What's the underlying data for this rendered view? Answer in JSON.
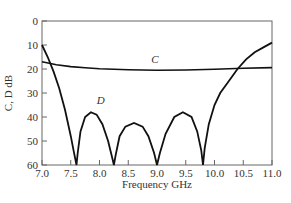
{
  "chart_data": {
    "type": "line",
    "title": "",
    "xlabel": "Frequency GHz",
    "ylabel": "C, D dB",
    "xlim": [
      7.0,
      11.0
    ],
    "ylim": [
      0,
      60
    ],
    "y_inverted": true,
    "grid": false,
    "x_ticks": [
      "7.0",
      "7.5",
      "8.0",
      "8.5",
      "9.0",
      "9.5",
      "10.0",
      "10.5",
      "11.0"
    ],
    "y_ticks": [
      "0",
      "10",
      "20",
      "30",
      "40",
      "50",
      "60"
    ],
    "series": [
      {
        "name": "C",
        "label_pos": {
          "x": 8.9,
          "y": 17.5
        },
        "x": [
          7.0,
          7.25,
          7.5,
          7.75,
          8.0,
          8.5,
          9.0,
          9.5,
          10.0,
          10.5,
          11.0
        ],
        "y": [
          17,
          18.2,
          19.0,
          19.5,
          19.9,
          20.3,
          20.5,
          20.4,
          20.1,
          19.7,
          19.4
        ]
      },
      {
        "name": "D",
        "label_pos": {
          "x": 7.95,
          "y": 34.5
        },
        "x": [
          7.0,
          7.1,
          7.2,
          7.3,
          7.4,
          7.5,
          7.55,
          7.6,
          7.62,
          7.67,
          7.75,
          7.85,
          7.95,
          8.05,
          8.15,
          8.22,
          8.25,
          8.28,
          8.35,
          8.45,
          8.6,
          8.75,
          8.85,
          8.95,
          9.0,
          9.05,
          9.15,
          9.3,
          9.45,
          9.6,
          9.7,
          9.77,
          9.8,
          9.83,
          9.9,
          10.0,
          10.1,
          10.25,
          10.4,
          10.55,
          10.7,
          10.85,
          11.0
        ],
        "y": [
          10,
          15,
          21,
          28,
          37,
          48,
          54,
          60,
          55,
          46,
          40,
          38,
          39,
          43,
          50,
          57,
          60,
          56,
          48,
          44,
          42.5,
          44,
          48,
          55,
          60,
          55,
          47,
          40,
          38,
          40,
          46,
          54,
          60,
          53,
          43,
          35,
          30,
          25,
          20,
          16,
          13,
          11,
          9
        ]
      }
    ]
  }
}
